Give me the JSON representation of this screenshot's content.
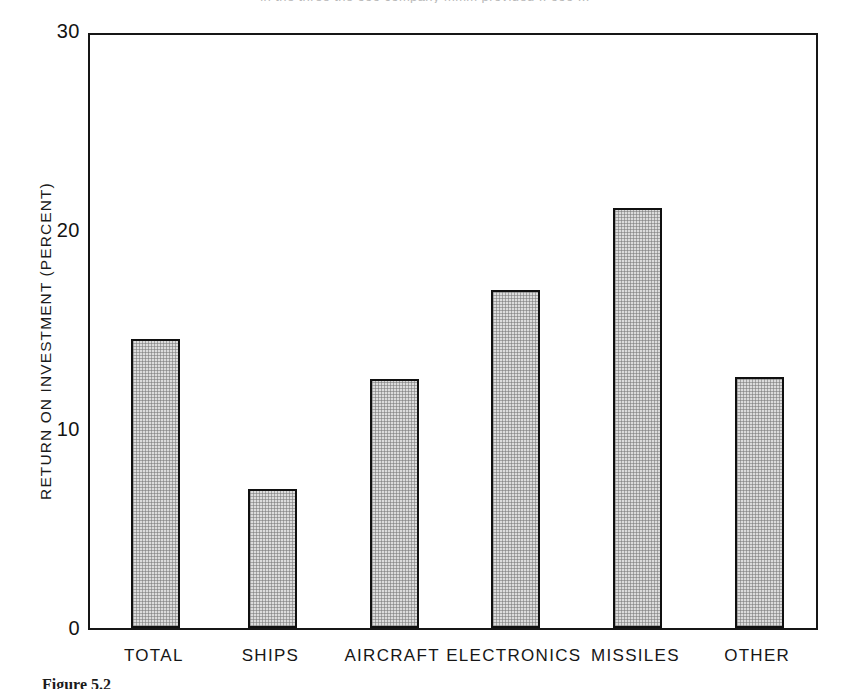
{
  "page": {
    "clipped_top_line": "in  the  three  the  ooo  company  mmm  provided  ..  ooo  ...",
    "caption": "Figure 5.2"
  },
  "chart_data": {
    "type": "bar",
    "title": "",
    "subtitle": "",
    "xlabel": "",
    "ylabel": "RETURN ON INVESTMENT (PERCENT)",
    "categories": [
      "TOTAL",
      "SHIPS",
      "AIRCRAFT",
      "ELECTRONICS",
      "MISSILES",
      "OTHER"
    ],
    "values": [
      14.5,
      7.0,
      12.5,
      17.0,
      21.1,
      12.6
    ],
    "ylim": [
      0,
      30
    ],
    "yticks": [
      0,
      10,
      20,
      30
    ],
    "ytick_labels": [
      "0",
      "10",
      "20",
      "30"
    ],
    "grid": false,
    "legend": false,
    "legend_position": "none",
    "bar_fill_color": "#dcdcdc",
    "bar_edge_color": "#101010",
    "frame_color": "#161616",
    "background_color": "#ffffff"
  }
}
